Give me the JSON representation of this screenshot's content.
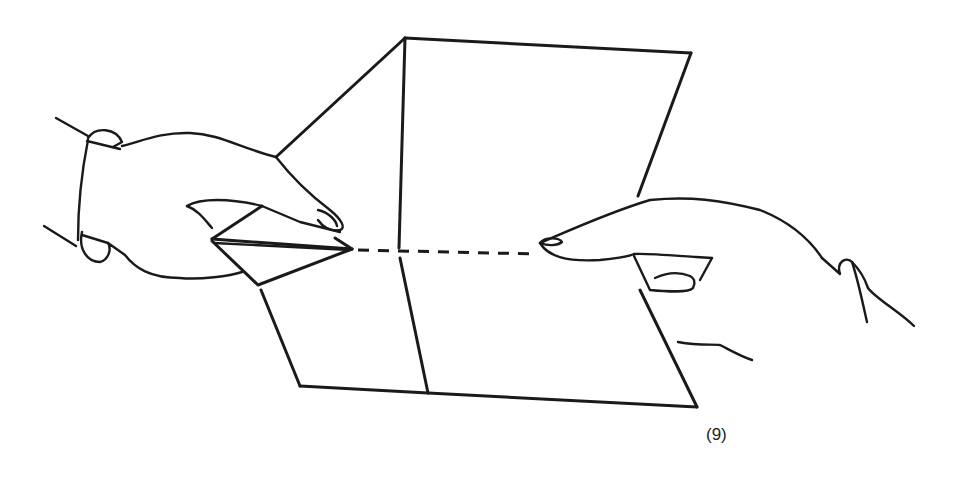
{
  "figure": {
    "step_label": "(9)",
    "line_color": "#1a1a1a",
    "background": "#ffffff"
  }
}
